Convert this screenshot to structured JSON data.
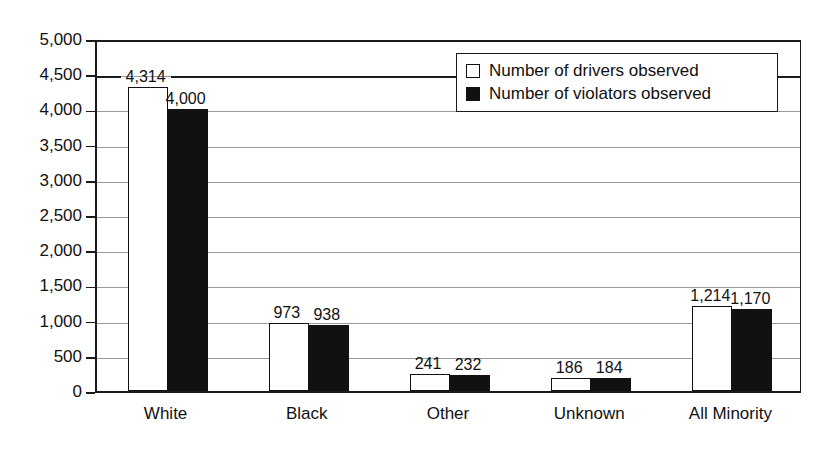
{
  "chart_data": {
    "type": "bar",
    "title": "",
    "subtitle": "",
    "xlabel": "",
    "ylabel": "",
    "categories": [
      "White",
      "Black",
      "Other",
      "Unknown",
      "All Minority"
    ],
    "series": [
      {
        "name": "Number of drivers observed",
        "color": "#ffffff",
        "values": [
          4314,
          973,
          241,
          186,
          1214
        ],
        "labels": [
          "4,314",
          "973",
          "241",
          "186",
          "1,214"
        ]
      },
      {
        "name": "Number of violators observed",
        "color": "#111111",
        "values": [
          4000,
          938,
          232,
          184,
          1170
        ],
        "labels": [
          "4,000",
          "938",
          "232",
          "184",
          "1,170"
        ]
      }
    ],
    "ylim": [
      0,
      5000
    ],
    "ytick_values": [
      0,
      500,
      1000,
      1500,
      2000,
      2500,
      3000,
      3500,
      4000,
      4500,
      5000
    ],
    "ytick_labels": [
      "0",
      "500",
      "1,000",
      "1,500",
      "2,000",
      "2,500",
      "3,000",
      "3,500",
      "4,000",
      "4,500",
      "5,000"
    ],
    "grid": true,
    "legend_position": "upper-right"
  },
  "legend": {
    "entries": [
      {
        "label": "Number of drivers observed",
        "swatch": "light"
      },
      {
        "label": "Number of violators observed",
        "swatch": "dark"
      }
    ]
  },
  "axis": {
    "y_labels": [
      "5,000",
      "4,500",
      "4,000",
      "3,500",
      "3,000",
      "2,500",
      "2,000",
      "1,500",
      "1,000",
      "500",
      "0"
    ],
    "x_labels": [
      "White",
      "Black",
      "Other",
      "Unknown",
      "All Minority"
    ]
  },
  "colors": {
    "series_light": "#ffffff",
    "series_dark": "#111111",
    "axis": "#1a1a1a",
    "gridline": "#9a9a9a",
    "background": "#ffffff",
    "text": "#111111"
  }
}
